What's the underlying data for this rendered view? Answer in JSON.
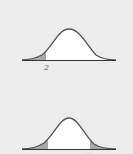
{
  "colors": {
    "background": "#ececec",
    "curve": "#555555",
    "fill": "#ffffff",
    "tail_shade": "#a9a9a9",
    "axis": "#333333"
  },
  "panels": [
    {
      "id": "top",
      "description": "Normal curve with left tail shaded",
      "shaded_tails": [
        "left"
      ],
      "label": "2"
    },
    {
      "id": "bottom",
      "description": "Normal curve with both tails shaded",
      "shaded_tails": [
        "left",
        "right"
      ],
      "label": "· ·"
    }
  ]
}
